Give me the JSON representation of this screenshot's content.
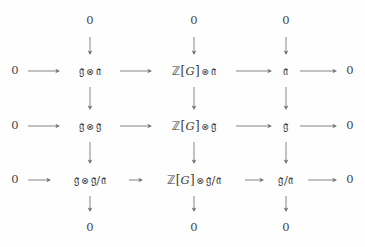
{
  "diagram": {
    "type": "commutative-diagram",
    "rows": 3,
    "columns": 3,
    "text_color": "#3d3d42",
    "arrow_color": "#6f6f77",
    "background": "#fefefe",
    "zero_label": "0",
    "tensor_symbol": "⊗",
    "grid": {
      "column_x": [
        90,
        194,
        286
      ],
      "row_y": [
        71,
        126,
        180
      ],
      "left_zero_x": 15,
      "right_zero_x": 350,
      "top_zero_y": 21,
      "bottom_zero_y": 228
    },
    "nodes": [
      {
        "id": "r1c1",
        "row": 1,
        "col": 1,
        "parts": [
          {
            "text": "𝔤",
            "style": "frak"
          },
          {
            "text": "⊗",
            "style": "tensor"
          },
          {
            "text": "𝔞",
            "style": "frak"
          }
        ],
        "plain": "g ⊗ a"
      },
      {
        "id": "r1c2",
        "row": 1,
        "col": 2,
        "parts": [
          {
            "text": "ℤ",
            "style": "bbZ"
          },
          {
            "text": "[",
            "style": "brk"
          },
          {
            "text": "G",
            "style": "ital"
          },
          {
            "text": "]",
            "style": "brk"
          },
          {
            "text": "⊗",
            "style": "tensor"
          },
          {
            "text": "𝔞",
            "style": "frak"
          }
        ],
        "plain": "Z[G] ⊗ a"
      },
      {
        "id": "r1c3",
        "row": 1,
        "col": 3,
        "parts": [
          {
            "text": "𝔞",
            "style": "frak"
          }
        ],
        "plain": "a"
      },
      {
        "id": "r2c1",
        "row": 2,
        "col": 1,
        "parts": [
          {
            "text": "𝔤",
            "style": "frak"
          },
          {
            "text": "⊗",
            "style": "tensor"
          },
          {
            "text": "𝔤",
            "style": "frak"
          }
        ],
        "plain": "g ⊗ g"
      },
      {
        "id": "r2c2",
        "row": 2,
        "col": 2,
        "parts": [
          {
            "text": "ℤ",
            "style": "bbZ"
          },
          {
            "text": "[",
            "style": "brk"
          },
          {
            "text": "G",
            "style": "ital"
          },
          {
            "text": "]",
            "style": "brk"
          },
          {
            "text": "⊗",
            "style": "tensor"
          },
          {
            "text": "𝔤",
            "style": "frak"
          }
        ],
        "plain": "Z[G] ⊗ g"
      },
      {
        "id": "r2c3",
        "row": 2,
        "col": 3,
        "parts": [
          {
            "text": "𝔤",
            "style": "frak"
          }
        ],
        "plain": "g"
      },
      {
        "id": "r3c1",
        "row": 3,
        "col": 1,
        "parts": [
          {
            "text": "𝔤",
            "style": "frak"
          },
          {
            "text": "⊗",
            "style": "tensor"
          },
          {
            "text": "𝔤",
            "style": "frak"
          },
          {
            "text": "/",
            "style": "slash"
          },
          {
            "text": "𝔞",
            "style": "frak"
          }
        ],
        "plain": "g ⊗ g/a"
      },
      {
        "id": "r3c2",
        "row": 3,
        "col": 2,
        "parts": [
          {
            "text": "ℤ",
            "style": "bbZ"
          },
          {
            "text": "[",
            "style": "brk"
          },
          {
            "text": "G",
            "style": "ital"
          },
          {
            "text": "]",
            "style": "brk"
          },
          {
            "text": "⊗",
            "style": "tensor"
          },
          {
            "text": "𝔤",
            "style": "frak"
          },
          {
            "text": "/",
            "style": "slash"
          },
          {
            "text": "𝔞",
            "style": "frak"
          }
        ],
        "plain": "Z[G] ⊗ g/a"
      },
      {
        "id": "r3c3",
        "row": 3,
        "col": 3,
        "parts": [
          {
            "text": "𝔤",
            "style": "frak"
          },
          {
            "text": "/",
            "style": "slash"
          },
          {
            "text": "𝔞",
            "style": "frak"
          }
        ],
        "plain": "g/a"
      }
    ],
    "boundary_zeros": {
      "left": [
        "0",
        "0",
        "0"
      ],
      "right": [
        "0",
        "0",
        "0"
      ],
      "top": [
        "0",
        "0",
        "0"
      ],
      "bottom": [
        "0",
        "0",
        "0"
      ]
    }
  }
}
